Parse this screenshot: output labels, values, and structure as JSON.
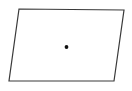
{
  "figure": {
    "kind": "geometry-diagram",
    "canvas": {
      "width": 132,
      "height": 91,
      "background_color": "#ffffff"
    },
    "shape": {
      "name": "parallelogram",
      "stroke_color": "#3a3a3a",
      "fill_color": "#ffffff",
      "stroke_width": 1.2,
      "points_attr": "19,9 124,10 114,81 9,81",
      "vertices": [
        {
          "label": "top-left",
          "x": 19,
          "y": 9
        },
        {
          "label": "top-right",
          "x": 124,
          "y": 10
        },
        {
          "label": "bottom-right",
          "x": 114,
          "y": 81
        },
        {
          "label": "bottom-left",
          "x": 9,
          "y": 81
        }
      ]
    },
    "marker": {
      "name": "center-point",
      "color": "#111111",
      "cx": 66.5,
      "cy": 47,
      "r": 1.9
    }
  }
}
